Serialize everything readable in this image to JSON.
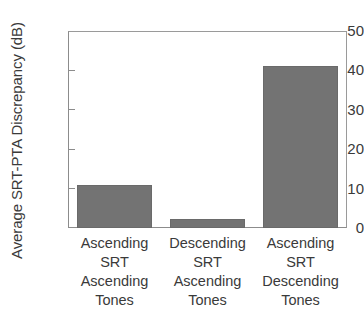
{
  "chart_data": {
    "type": "bar",
    "title": "",
    "subtitle": "",
    "xlabel": "",
    "ylabel": "Average SRT-PTA Discrepancy (dB)",
    "categories": [
      "Ascending SRT Ascending Tones",
      "Descending SRT Ascending Tones",
      "Ascending SRT Descending Tones"
    ],
    "category_lines": [
      [
        "Ascending",
        "SRT",
        "Ascending",
        "Tones"
      ],
      [
        "Descending",
        "SRT",
        "Ascending",
        "Tones"
      ],
      [
        "Ascending",
        "SRT",
        "Descending",
        "Tones"
      ]
    ],
    "values": [
      10.9,
      2.3,
      41.1
    ],
    "ylim": [
      0,
      50
    ],
    "yticks": [
      0,
      10,
      20,
      30,
      40,
      50
    ],
    "ytick_labels": [
      "0",
      "10",
      "20",
      "30",
      "40",
      "50"
    ],
    "grid": false,
    "legend": false,
    "legend_position": "none",
    "bar_color": "#737373",
    "bar_edge_color": "#6a6a6a",
    "axis_color": "#8c8c8c",
    "text_color": "#3a3a3a",
    "background_color": "#ffffff"
  }
}
